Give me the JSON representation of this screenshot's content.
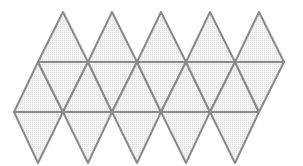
{
  "diagram": {
    "type": "icosahedron-net",
    "triangle_count": 20,
    "rows": [
      {
        "name": "top-cap",
        "triangles": 5
      },
      {
        "name": "middle-band",
        "triangles": 10
      },
      {
        "name": "bottom-cap",
        "triangles": 5
      }
    ],
    "colors": {
      "fill": "#ececec",
      "stroke": "#8a8a8a",
      "background": "#ffffff"
    }
  }
}
